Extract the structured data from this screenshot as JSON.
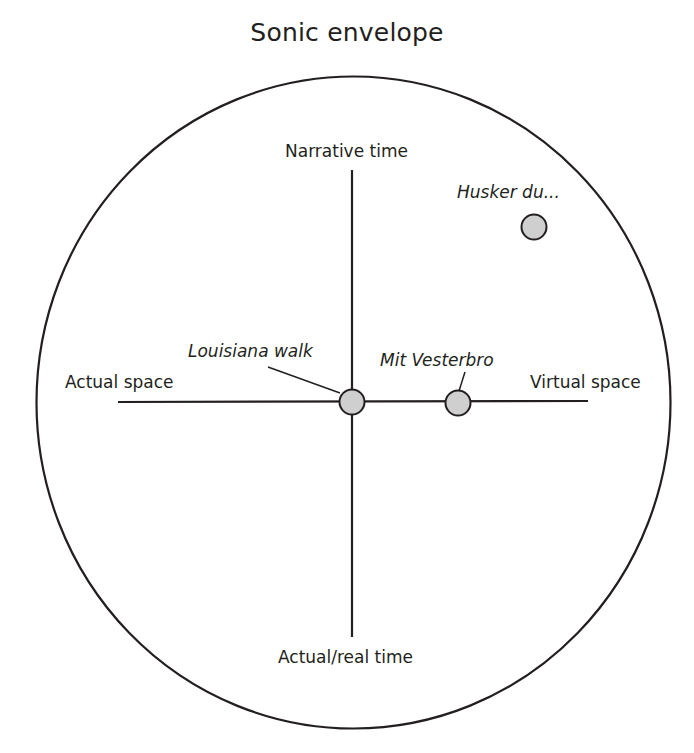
{
  "title": "Sonic envelope",
  "axes": {
    "top": "Narrative time",
    "bottom": "Actual/real time",
    "left": "Actual space",
    "right": "Virtual space"
  },
  "points": [
    {
      "label": "Louisiana walk",
      "x": 0.0,
      "y": 0.0
    },
    {
      "label": "Mit Vesterbro",
      "x": 0.45,
      "y": 0.0
    },
    {
      "label": "Husker du...",
      "x": 0.78,
      "y": 0.76
    }
  ],
  "colors": {
    "stroke": "#231f20",
    "point_fill": "#cfcfcf",
    "background": "#ffffff"
  }
}
